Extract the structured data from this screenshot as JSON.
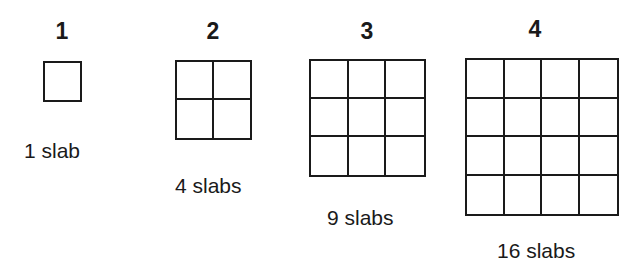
{
  "figures": [
    {
      "number": "1",
      "label": "1 slab",
      "n": 1
    },
    {
      "number": "2",
      "label": "4 slabs",
      "n": 2
    },
    {
      "number": "3",
      "label": "9 slabs",
      "n": 3
    },
    {
      "number": "4",
      "label": "16 slabs",
      "n": 4
    }
  ],
  "colors": {
    "line": "#1a1a1a",
    "background": "#ffffff"
  }
}
